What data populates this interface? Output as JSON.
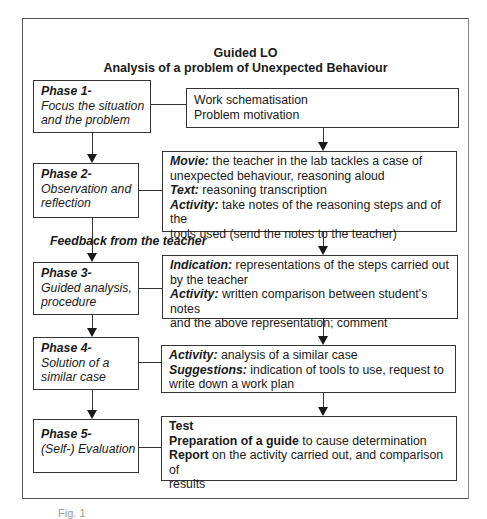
{
  "title": {
    "line1": "Guided LO",
    "line2": "Analysis of a problem of Unexpected Behaviour"
  },
  "phases": [
    {
      "title": "Phase 1-",
      "subtitle": "Focus the situation\nand the problem"
    },
    {
      "title": "Phase 2-",
      "subtitle": "Observation and\nreflection"
    },
    {
      "title": "Phase 3-",
      "subtitle": "Guided analysis,\nprocedure"
    },
    {
      "title": "Phase 4-",
      "subtitle": "Solution of a\nsimilar case"
    },
    {
      "title": "Phase 5-",
      "subtitle": "(Self-) Evaluation"
    }
  ],
  "contents": [
    {
      "lines": [
        {
          "label": "",
          "text": "Work schematisation"
        },
        {
          "label": "",
          "text": "Problem motivation"
        }
      ]
    },
    {
      "lines": [
        {
          "label": "Movie:",
          "text": " the teacher in the lab tackles a case of"
        },
        {
          "label": "",
          "text": "unexpected behaviour, reasoning aloud"
        },
        {
          "label": "Text:",
          "text": " reasoning transcription"
        },
        {
          "label": "Activity:",
          "text": " take notes of the reasoning steps and of the"
        },
        {
          "label": "",
          "text": "tools used (send the notes to the teacher)"
        }
      ]
    },
    {
      "lines": [
        {
          "label": "Indication:",
          "text": " representations of the steps carried out"
        },
        {
          "label": "",
          "text": "by the teacher"
        },
        {
          "label": "Activity:",
          "text": " written comparison between student's notes"
        },
        {
          "label": "",
          "text": "and the above representation; comment"
        }
      ]
    },
    {
      "lines": [
        {
          "label": "Activity:",
          "text": " analysis of a similar case"
        },
        {
          "label": "Suggestions:",
          "text": " indication of tools to use, request to"
        },
        {
          "label": "",
          "text": "write down a work plan"
        }
      ]
    },
    {
      "lines": [
        {
          "label": "Test",
          "text": ""
        },
        {
          "label": "Preparation of a guide",
          "text": " to cause determination"
        },
        {
          "label": "Report",
          "text": " on the activity carried out, and comparison of"
        },
        {
          "label": "",
          "text": "results"
        }
      ]
    }
  ],
  "feedback_label": "Feedback from the teacher",
  "caption": "Fig. 1"
}
